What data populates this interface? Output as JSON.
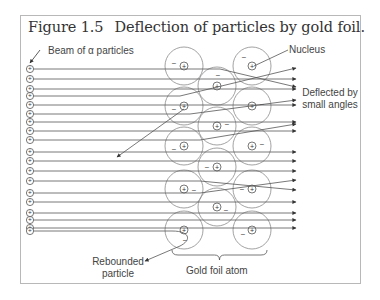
{
  "figure": {
    "number": "Figure 1.5",
    "caption": "Deflection of particles by gold foil.",
    "frame_color": "#b8b8b8",
    "line_color": "#555555"
  },
  "labels": {
    "beam": "Beam of α particles",
    "nucleus": "Nucleus",
    "deflected_line1": "Deflected by",
    "deflected_line2": "small angles",
    "rebounded_line1": "Rebounded",
    "rebounded_line2": "particle",
    "gold_foil_atom": "Gold foil atom"
  },
  "symbols": {
    "positive": "+",
    "negative": "−"
  },
  "alpha_particles_y": [
    69,
    79,
    89,
    96,
    105,
    114,
    122,
    131,
    140,
    152,
    161,
    171,
    181,
    193,
    202,
    213,
    220,
    228
  ],
  "atoms": [
    {
      "cx": 184,
      "cy": 66,
      "r": 19,
      "minus": [
        -10,
        -3
      ]
    },
    {
      "cx": 184,
      "cy": 106,
      "r": 19,
      "minus": [
        -10,
        3
      ]
    },
    {
      "cx": 184,
      "cy": 146,
      "r": 19,
      "minus": [
        -10,
        3
      ]
    },
    {
      "cx": 184,
      "cy": 189,
      "r": 19,
      "minus": [
        10,
        1
      ]
    },
    {
      "cx": 184,
      "cy": 230,
      "r": 19,
      "minus": [
        1,
        10
      ]
    },
    {
      "cx": 217,
      "cy": 86,
      "r": 19,
      "minus": [
        1,
        -11
      ]
    },
    {
      "cx": 217,
      "cy": 126,
      "r": 19,
      "minus": [
        10,
        -2
      ]
    },
    {
      "cx": 217,
      "cy": 167,
      "r": 19,
      "minus": [
        -10,
        0
      ]
    },
    {
      "cx": 217,
      "cy": 207,
      "r": 19,
      "minus": [
        9,
        3
      ]
    },
    {
      "cx": 252,
      "cy": 66,
      "r": 19,
      "minus": [
        -8,
        -9
      ]
    },
    {
      "cx": 252,
      "cy": 106,
      "r": 19,
      "minus": [
        10,
        -2
      ]
    },
    {
      "cx": 252,
      "cy": 146,
      "r": 19,
      "minus": [
        10,
        -2
      ]
    },
    {
      "cx": 252,
      "cy": 189,
      "r": 19,
      "minus": [
        -10,
        0
      ]
    },
    {
      "cx": 252,
      "cy": 230,
      "r": 19,
      "minus": [
        -9,
        4
      ]
    }
  ],
  "trajectories": [
    {
      "points": [
        [
          33,
          69
        ],
        [
          220,
          69
        ],
        [
          296,
          87
        ]
      ]
    },
    {
      "points": [
        [
          33,
          79
        ],
        [
          296,
          79
        ]
      ]
    },
    {
      "points": [
        [
          33,
          89
        ],
        [
          296,
          89
        ]
      ]
    },
    {
      "points": [
        [
          33,
          96
        ],
        [
          180,
          96
        ],
        [
          296,
          68
        ]
      ]
    },
    {
      "points": [
        [
          33,
          105
        ],
        [
          296,
          105
        ]
      ]
    },
    {
      "points": [
        [
          33,
          114
        ],
        [
          190,
          114
        ],
        [
          296,
          100
        ]
      ]
    },
    {
      "points": [
        [
          33,
          122
        ],
        [
          296,
          122
        ]
      ]
    },
    {
      "points": [
        [
          33,
          131
        ],
        [
          296,
          131
        ]
      ]
    },
    {
      "points": [
        [
          33,
          140
        ],
        [
          200,
          140
        ],
        [
          296,
          124
        ]
      ]
    },
    {
      "points": [
        [
          33,
          152
        ],
        [
          296,
          152
        ]
      ]
    },
    {
      "points": [
        [
          33,
          161
        ],
        [
          296,
          161
        ]
      ]
    },
    {
      "points": [
        [
          33,
          171
        ],
        [
          296,
          171
        ]
      ]
    },
    {
      "points": [
        [
          33,
          181
        ],
        [
          200,
          181
        ],
        [
          296,
          190
        ]
      ]
    },
    {
      "points": [
        [
          33,
          193
        ],
        [
          200,
          193
        ],
        [
          296,
          180
        ]
      ]
    },
    {
      "points": [
        [
          33,
          202
        ],
        [
          296,
          202
        ]
      ]
    },
    {
      "points": [
        [
          33,
          213
        ],
        [
          296,
          213
        ]
      ]
    },
    {
      "points": [
        [
          33,
          220
        ],
        [
          296,
          220
        ]
      ]
    },
    {
      "points": [
        [
          33,
          228
        ],
        [
          296,
          228
        ]
      ]
    }
  ],
  "large_angle_ray": {
    "from": [
      184,
      109
    ],
    "to": [
      117,
      157
    ]
  },
  "rebound_ray": {
    "path": "M33,231 L172,231 C190,231 192,240 180,246 L145,261"
  },
  "callouts": {
    "beam_arrow": {
      "from": [
        40,
        50
      ],
      "to": [
        30,
        63
      ]
    },
    "nucleus_line": {
      "from": [
        254,
        66
      ],
      "to": [
        288,
        50
      ]
    }
  },
  "bracket": {
    "x1": 172,
    "x2": 267,
    "y": 255
  }
}
